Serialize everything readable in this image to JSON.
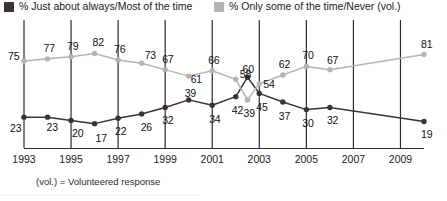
{
  "legend": {
    "dark": {
      "label": "% Just about always/Most of the time",
      "color": "#3b3331",
      "swatch_name": "legend-swatch-dark"
    },
    "light": {
      "label": "% Only some of the time/Never (vol.)",
      "color": "#b3b3b3",
      "swatch_name": "legend-swatch-light"
    }
  },
  "footnote": "(vol.) = Volunteered response",
  "axis": {
    "ticks": [
      "1993",
      "1995",
      "1997",
      "1999",
      "2001",
      "2003",
      "2005",
      "2007",
      "2009"
    ]
  },
  "chart_data": {
    "type": "line",
    "title": "",
    "xlabel": "",
    "ylabel": "",
    "ylim": [
      0,
      100
    ],
    "xlim": [
      1993,
      2010
    ],
    "grid": "vertical-only",
    "legend_position": "top",
    "x": [
      1993,
      1994,
      1995,
      1996,
      1997,
      1998,
      1999,
      2000,
      2001,
      2002,
      2002.5,
      2003,
      2004,
      2005,
      2006,
      2010
    ],
    "series": [
      {
        "name": "% Just about always/Most of the time",
        "color": "#3b3331",
        "values": [
          23,
          23,
          20,
          17,
          22,
          26,
          32,
          39,
          34,
          42,
          60,
          45,
          37,
          30,
          32,
          19
        ]
      },
      {
        "name": "% Only some of the time/Never (vol.)",
        "color": "#b3b3b3",
        "values": [
          75,
          77,
          79,
          82,
          76,
          73,
          67,
          61,
          66,
          58,
          39,
          54,
          62,
          70,
          67,
          81
        ]
      }
    ],
    "labels": {
      "dark": [
        {
          "text": "23",
          "value": 23
        },
        {
          "text": "23",
          "value": 23
        },
        {
          "text": "20",
          "value": 20
        },
        {
          "text": "17",
          "value": 17
        },
        {
          "text": "22",
          "value": 22
        },
        {
          "text": "26",
          "value": 26
        },
        {
          "text": "32",
          "value": 32
        },
        {
          "text": "39",
          "value": 39
        },
        {
          "text": "34",
          "value": 34
        },
        {
          "text": "42",
          "value": 42
        },
        {
          "text": "60",
          "value": 60
        },
        {
          "text": "45",
          "value": 45
        },
        {
          "text": "37",
          "value": 37
        },
        {
          "text": "30",
          "value": 30
        },
        {
          "text": "32",
          "value": 32
        },
        {
          "text": "19",
          "value": 19
        }
      ],
      "light": [
        {
          "text": "75",
          "value": 75
        },
        {
          "text": "77",
          "value": 77
        },
        {
          "text": "79",
          "value": 79
        },
        {
          "text": "82",
          "value": 82
        },
        {
          "text": "76",
          "value": 76
        },
        {
          "text": "73",
          "value": 73
        },
        {
          "text": "67",
          "value": 67
        },
        {
          "text": "61",
          "value": 61
        },
        {
          "text": "66",
          "value": 66
        },
        {
          "text": "58",
          "value": 58
        },
        {
          "text": "39",
          "value": 39
        },
        {
          "text": "54",
          "value": 54
        },
        {
          "text": "62",
          "value": 62
        },
        {
          "text": "70",
          "value": 70
        },
        {
          "text": "67",
          "value": 67
        },
        {
          "text": "81",
          "value": 81
        }
      ]
    }
  }
}
